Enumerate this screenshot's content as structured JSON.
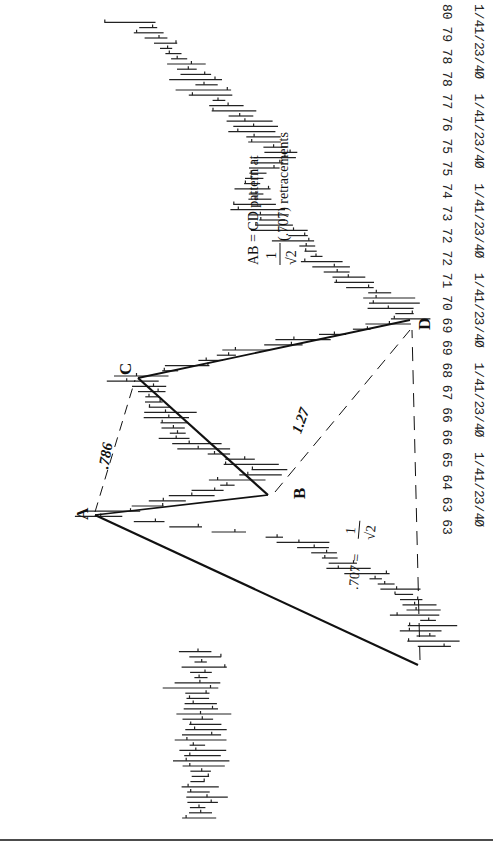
{
  "chart_data": {
    "type": "bar",
    "subtype": "OHLC price bars (page rotated 90 degrees)",
    "title": "",
    "annotation": {
      "line1": "AB = CD pattern at",
      "fraction": "1/√2",
      "line2": "(.707) retracements"
    },
    "price_axis": {
      "ticks": [
        {
          "whole": "80",
          "frac": "1/4"
        },
        {
          "whole": "79",
          "frac": "1/2"
        },
        {
          "whole": "78",
          "frac": "3/4"
        },
        {
          "whole": "78",
          "frac": "0"
        },
        {
          "whole": "77",
          "frac": "1/4"
        },
        {
          "whole": "76",
          "frac": "1/2"
        },
        {
          "whole": "75",
          "frac": "3/4"
        },
        {
          "whole": "75",
          "frac": "0"
        },
        {
          "whole": "74",
          "frac": "1/4"
        },
        {
          "whole": "73",
          "frac": "1/2"
        },
        {
          "whole": "72",
          "frac": "3/4"
        },
        {
          "whole": "72",
          "frac": "0"
        },
        {
          "whole": "71",
          "frac": "1/4"
        },
        {
          "whole": "70",
          "frac": "1/2"
        },
        {
          "whole": "69",
          "frac": "3/4"
        },
        {
          "whole": "69",
          "frac": "0"
        },
        {
          "whole": "68",
          "frac": "1/4"
        },
        {
          "whole": "67",
          "frac": "1/2"
        },
        {
          "whole": "66",
          "frac": "3/4"
        },
        {
          "whole": "66",
          "frac": "0"
        },
        {
          "whole": "65",
          "frac": "1/4"
        },
        {
          "whole": "64",
          "frac": "1/2"
        },
        {
          "whole": "63",
          "frac": "3/4"
        },
        {
          "whole": "63",
          "frac": "0"
        }
      ],
      "range": [
        63,
        80.25
      ]
    },
    "pattern_points": {
      "A": {
        "label": "A",
        "price": 64.1
      },
      "B": {
        "label": "B",
        "price": 64.7
      },
      "C": {
        "label": "C",
        "price": 68.3
      },
      "D": {
        "label": "D",
        "price": 70.0
      },
      "origin_low": {
        "label": "",
        "price": 74.8
      }
    },
    "ratios": {
      "AC": ".786",
      "BD": "1.27",
      "XD": ".707 = 1/√2"
    }
  },
  "labels": {
    "A": "A",
    "B": "B",
    "C": "C",
    "D": "D",
    "ratio_ac": ".786",
    "ratio_bd": "1.27",
    "ratio_xd_prefix": ".707 =",
    "ratio_xd_num": "1",
    "ratio_xd_den": "√2",
    "note_line1": "AB = CD pattern at",
    "note_num": "1",
    "note_den": "√2",
    "note_line2": "(.707) retracements"
  }
}
